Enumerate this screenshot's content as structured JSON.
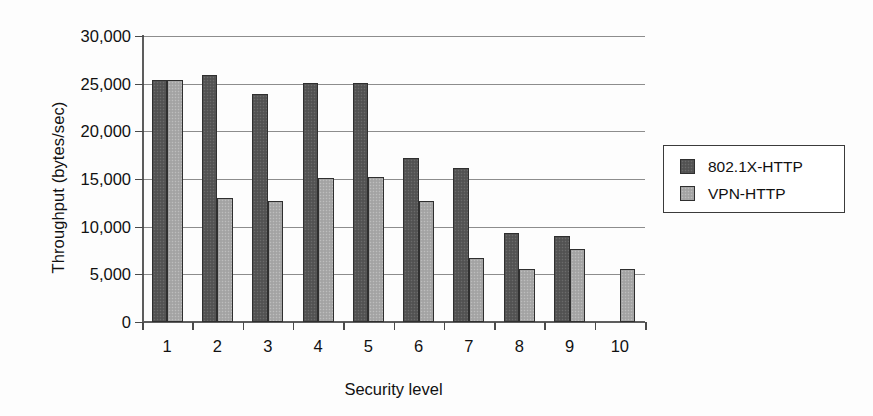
{
  "chart_data": {
    "type": "bar",
    "title": "",
    "xlabel": "Security level",
    "ylabel": "Throughput (bytes/sec)",
    "categories": [
      "1",
      "2",
      "3",
      "4",
      "5",
      "6",
      "7",
      "8",
      "9",
      "10"
    ],
    "ylim": [
      0,
      30000
    ],
    "yticks": [
      0,
      5000,
      10000,
      15000,
      20000,
      25000,
      30000
    ],
    "ytick_labels": [
      "0",
      "5,000",
      "10,000",
      "15,000",
      "20,000",
      "25,000",
      "30,000"
    ],
    "grid": "horizontal",
    "legend_position": "right",
    "series": [
      {
        "name": "802.1X-HTTP",
        "color": "#575757",
        "values": [
          25400,
          25900,
          23900,
          25100,
          25100,
          17200,
          16200,
          9300,
          9000,
          null
        ]
      },
      {
        "name": "VPN-HTTP",
        "color": "#a8a8a8",
        "values": [
          25400,
          13000,
          12700,
          15100,
          15200,
          12700,
          6700,
          5600,
          7700,
          5600
        ]
      }
    ]
  }
}
